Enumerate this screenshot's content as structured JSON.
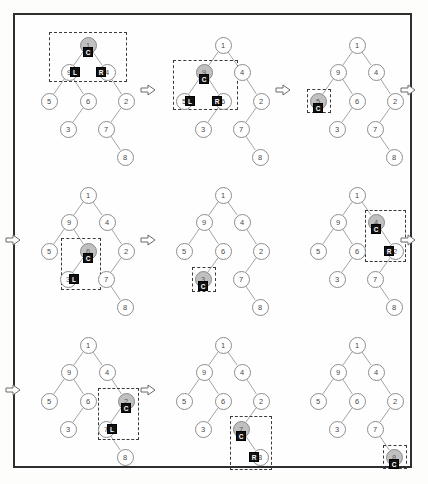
{
  "figure": {
    "border_color": "#2e2e2e",
    "background_color": "#fefefe",
    "node_fill": "#ffffff",
    "node_highlight_fill": "#c0c0c0",
    "badge_fill": "#111111",
    "badge_text_color": "#ffffff",
    "edge_color": "#9a9a9a",
    "dashed_box_color": "#3a3a3a",
    "arrow_glyph": "double-arrow-right"
  },
  "tree": {
    "nodes": [
      {
        "id": "root",
        "label": "1",
        "x": 68,
        "y": 23
      },
      {
        "id": "n9",
        "label": "9",
        "x": 49,
        "y": 50
      },
      {
        "id": "n4",
        "label": "4",
        "x": 87,
        "y": 50
      },
      {
        "id": "n5",
        "label": "5",
        "x": 29,
        "y": 79
      },
      {
        "id": "n6",
        "label": "6",
        "x": 68,
        "y": 79
      },
      {
        "id": "n2",
        "label": "2",
        "x": 106,
        "y": 79
      },
      {
        "id": "n3",
        "label": "3",
        "x": 48,
        "y": 107
      },
      {
        "id": "n7",
        "label": "7",
        "x": 86,
        "y": 107
      },
      {
        "id": "n8",
        "label": "8",
        "x": 105,
        "y": 135
      }
    ],
    "edges": [
      [
        "root",
        "n9"
      ],
      [
        "root",
        "n4"
      ],
      [
        "n9",
        "n5"
      ],
      [
        "n9",
        "n6"
      ],
      [
        "n4",
        "n2"
      ],
      [
        "n6",
        "n3"
      ],
      [
        "n2",
        "n7"
      ],
      [
        "n7",
        "n8"
      ]
    ]
  },
  "badge_labels": {
    "current": "C",
    "left": "L",
    "right": "R"
  },
  "steps": [
    {
      "index": 1,
      "panel_x": 20,
      "panel_y": 22,
      "current": "root",
      "current_badge": "C",
      "marks": [
        {
          "node": "n9",
          "badge": "L",
          "side": "right"
        },
        {
          "node": "n4",
          "badge": "R",
          "side": "left"
        }
      ],
      "box": {
        "x": 29,
        "y": 10,
        "w": 78,
        "h": 50
      },
      "arrow": {
        "x": 140,
        "y": 90
      }
    },
    {
      "index": 2,
      "panel_x": 155,
      "panel_y": 22,
      "current": "n9",
      "current_badge": "C",
      "marks": [
        {
          "node": "n5",
          "badge": "L",
          "side": "right"
        },
        {
          "node": "n6",
          "badge": "R",
          "side": "left"
        }
      ],
      "box": {
        "x": 18,
        "y": 38,
        "w": 65,
        "h": 50
      },
      "arrow": {
        "x": 275,
        "y": 90
      }
    },
    {
      "index": 3,
      "panel_x": 289,
      "panel_y": 22,
      "current": "n5",
      "current_badge": "C",
      "marks": [],
      "box": {
        "x": 18,
        "y": 67,
        "w": 24,
        "h": 24
      },
      "arrow": {
        "x": 400,
        "y": 90
      }
    },
    {
      "index": 4,
      "panel_x": 20,
      "panel_y": 172,
      "current": "n6",
      "current_badge": "C",
      "marks": [
        {
          "node": "n3",
          "badge": "L",
          "side": "right"
        }
      ],
      "box": {
        "x": 41,
        "y": 66,
        "w": 40,
        "h": 52
      },
      "arrow": {
        "x": 5,
        "y": 240
      }
    },
    {
      "index": 5,
      "panel_x": 155,
      "panel_y": 172,
      "current": "n3",
      "current_badge": "C",
      "marks": [],
      "box": {
        "x": 37,
        "y": 95,
        "w": 24,
        "h": 25
      },
      "arrow": {
        "x": 140,
        "y": 240
      }
    },
    {
      "index": 6,
      "panel_x": 289,
      "panel_y": 172,
      "current": "n4",
      "current_badge": "C",
      "marks": [
        {
          "node": "n2",
          "badge": "R",
          "side": "left"
        }
      ],
      "box": {
        "x": 76,
        "y": 38,
        "w": 41,
        "h": 52
      },
      "arrow": {
        "x": 400,
        "y": 240
      }
    },
    {
      "index": 7,
      "panel_x": 20,
      "panel_y": 322,
      "current": "n2",
      "current_badge": "C",
      "marks": [
        {
          "node": "n7",
          "badge": "L",
          "side": "right"
        }
      ],
      "box": {
        "x": 78,
        "y": 66,
        "w": 41,
        "h": 52
      },
      "arrow": {
        "x": 5,
        "y": 390
      }
    },
    {
      "index": 8,
      "panel_x": 155,
      "panel_y": 322,
      "current": "n7",
      "current_badge": "C",
      "marks": [
        {
          "node": "n8",
          "badge": "R",
          "side": "left"
        }
      ],
      "box": {
        "x": 75,
        "y": 94,
        "w": 42,
        "h": 54
      },
      "arrow": {
        "x": 140,
        "y": 390
      }
    },
    {
      "index": 9,
      "panel_x": 289,
      "panel_y": 322,
      "current": "n8",
      "current_badge": "C",
      "marks": [],
      "box": {
        "x": 94,
        "y": 123,
        "w": 24,
        "h": 24
      },
      "arrow": null
    }
  ]
}
